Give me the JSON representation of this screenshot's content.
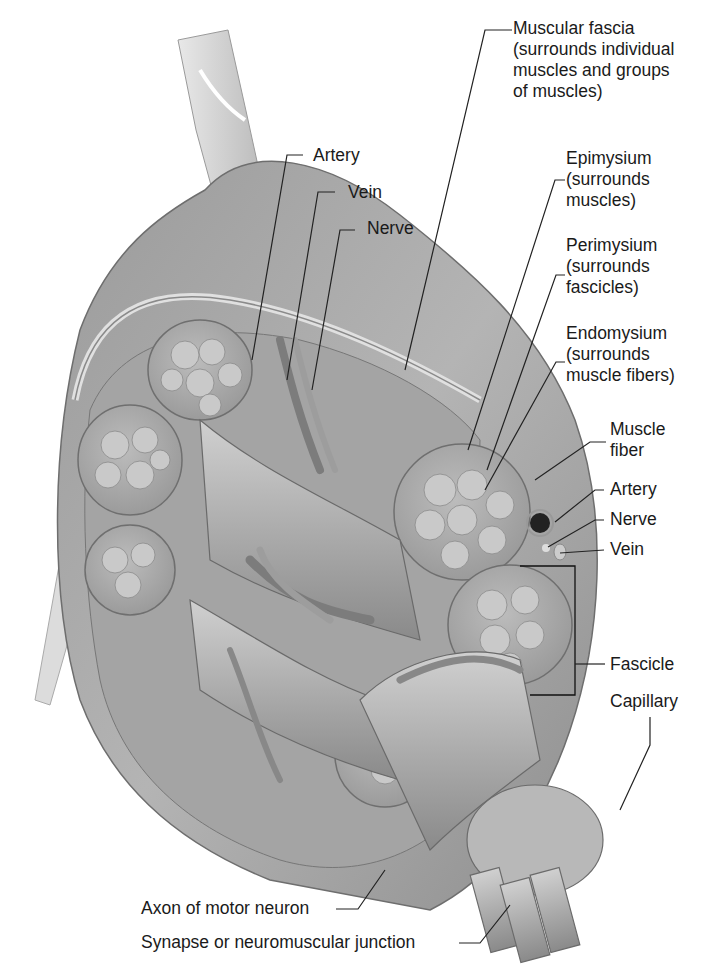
{
  "figure": {
    "colors": {
      "tissue_light": "#c8c8c8",
      "tissue_mid": "#a6a6a6",
      "tissue_dark": "#7a7a7a",
      "leader_line": "#222222",
      "text": "#1a1a1a",
      "background": "#ffffff"
    }
  },
  "labels": {
    "muscular_fascia": "Muscular fascia\n(surrounds individual\nmuscles and groups\nof muscles)",
    "artery_top": "Artery",
    "vein_top": "Vein",
    "nerve_top": "Nerve",
    "epimysium": "Epimysium\n(surrounds\nmuscles)",
    "perimysium": "Perimysium\n(surrounds\nfascicles)",
    "endomysium": "Endomysium\n(surrounds\nmuscle fibers)",
    "muscle_fiber": "Muscle\nfiber",
    "artery_right": "Artery",
    "nerve_right": "Nerve",
    "vein_right": "Vein",
    "fascicle": "Fascicle",
    "capillary": "Capillary",
    "axon": "Axon of motor neuron",
    "synapse": "Synapse or neuromuscular junction"
  }
}
